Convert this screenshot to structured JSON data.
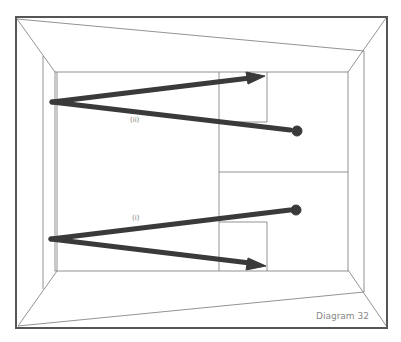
{
  "diagram": {
    "caption": "Diagram 32",
    "labels": {
      "upper": "(ii)",
      "lower": "(i)"
    },
    "colors": {
      "frame": "#555555",
      "thin_line": "#777777",
      "arrow": "#3a3a3a",
      "background": "#ffffff"
    },
    "elements": {
      "outer_frame": "room-perspective-frame",
      "upper_path": "ray-ii-with-arrow-and-dot",
      "lower_path": "ray-i-with-arrow-and-dot"
    }
  }
}
